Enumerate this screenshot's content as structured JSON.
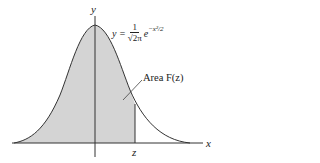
{
  "diagram": {
    "axis_labels": {
      "x": "x",
      "y": "y"
    },
    "z_label": "z",
    "formula": {
      "lhs": "y =",
      "numerator": "1",
      "denominator": "√2π",
      "base": "e",
      "exponent": "−x²/2"
    },
    "area_label": "Area F(z)",
    "colors": {
      "fill": "#d4d4d4",
      "stroke": "#333333"
    }
  }
}
